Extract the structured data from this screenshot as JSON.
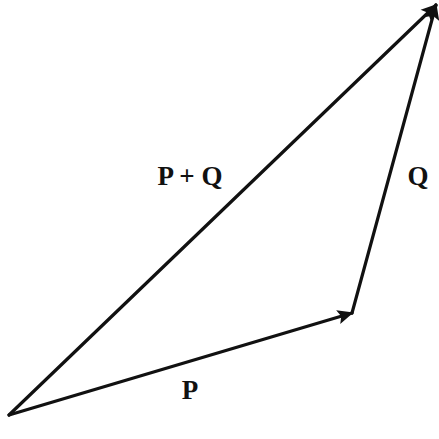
{
  "diagram": {
    "colors": {
      "background": "#ffffff",
      "stroke": "#111111"
    },
    "points": {
      "origin": {
        "x": 9,
        "y": 415
      },
      "p_tip": {
        "x": 352,
        "y": 313
      },
      "apex": {
        "x": 436,
        "y": 5
      }
    },
    "vectors": [
      {
        "name": "P",
        "from": "origin",
        "to": "p_tip"
      },
      {
        "name": "Q",
        "from": "p_tip",
        "to": "apex"
      },
      {
        "name": "P + Q",
        "from": "origin",
        "to": "apex"
      }
    ],
    "labels": {
      "p": {
        "text": "P",
        "x": 190,
        "y": 390
      },
      "q": {
        "text": "Q",
        "x": 418,
        "y": 176
      },
      "sum": {
        "text": "P + Q",
        "x": 190,
        "y": 176
      }
    }
  }
}
